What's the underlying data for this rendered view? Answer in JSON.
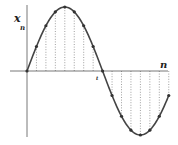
{
  "chart_data": {
    "type": "line",
    "title": "",
    "xlabel": "n",
    "ylabel": "x_n",
    "ylabel_main": "x",
    "ylabel_sub": "n",
    "annotation": "t",
    "x": [
      0,
      1,
      2,
      3,
      4,
      5,
      6,
      7,
      8,
      9,
      10,
      11,
      12,
      13,
      14,
      15
    ],
    "series": [
      {
        "name": "x_n = sin(nπ/8)",
        "values": [
          0,
          0.383,
          0.707,
          0.924,
          1,
          0.924,
          0.707,
          0.383,
          0,
          -0.383,
          -0.707,
          -0.924,
          -1,
          -0.924,
          -0.707,
          -0.383
        ]
      }
    ],
    "ylim": [
      -1,
      1
    ],
    "grid": false,
    "stems": true,
    "legend": "none"
  },
  "layout": {
    "origin_x": 27,
    "origin_y": 71,
    "step_x": 9.45,
    "amplitude_px": 64,
    "colors": {
      "curve": "#444444",
      "points": "#333333",
      "axis": "#555555",
      "stems": "#777777"
    }
  }
}
